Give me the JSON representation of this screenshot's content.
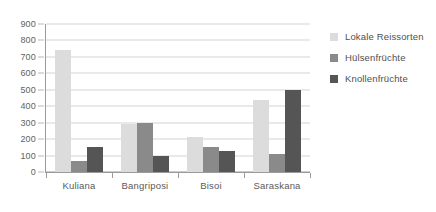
{
  "chart_data": {
    "type": "bar",
    "title": "",
    "subtitle": "",
    "xlabel": "",
    "ylabel": "",
    "categories": [
      "Kuliana",
      "Bangriposi",
      "Bisoi",
      "Saraskana"
    ],
    "series": [
      {
        "name": "Lokale Reissorten",
        "color": "#dcdcdc",
        "values": [
          740,
          290,
          210,
          440
        ]
      },
      {
        "name": "Hülsenfrüchte",
        "color": "#8a8a8a",
        "values": [
          70,
          300,
          150,
          110
        ]
      },
      {
        "name": "Knollenfrüchte",
        "color": "#555555",
        "values": [
          150,
          100,
          130,
          500
        ]
      }
    ],
    "ylim": [
      0,
      900
    ],
    "ytick_step": 100,
    "yticks": [
      900,
      800,
      700,
      600,
      500,
      400,
      300,
      200,
      100,
      0
    ],
    "ytick_labels": [
      "900",
      "800",
      "700",
      "600",
      "500",
      "400",
      "300",
      "200",
      "100",
      "0"
    ],
    "grid": true,
    "grid_axis": "y",
    "legend_position": "right",
    "orientation": "vertical",
    "grouping": "grouped"
  },
  "colors": {
    "background": "#ffffff",
    "gridline": "#d4d4d4",
    "axis": "#9a9a9a",
    "text": "#5a5a5a",
    "series_light": "#dcdcdc",
    "series_medium": "#8a8a8a",
    "series_dark": "#555555"
  }
}
